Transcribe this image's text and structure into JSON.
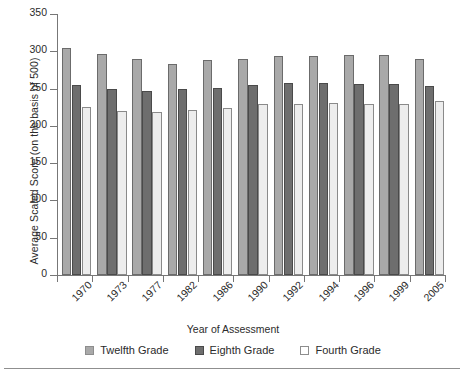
{
  "chart_data": {
    "type": "bar",
    "title": "",
    "xlabel": "Year of Assessment",
    "ylabel": "Average Scaled Score (on the basis of 500)",
    "categories": [
      "1970",
      "1973",
      "1977",
      "1982",
      "1986",
      "1990",
      "1992",
      "1994",
      "1996",
      "1999",
      "2005"
    ],
    "series": [
      {
        "name": "Twelfth Grade",
        "color": "#a9a9a9",
        "values": [
          305,
          296,
          290,
          283,
          288,
          290,
          294,
          294,
          295,
          295,
          290
        ]
      },
      {
        "name": "Eighth Grade",
        "color": "#6e6e6e",
        "values": [
          255,
          250,
          247,
          250,
          251,
          255,
          258,
          257,
          256,
          256,
          254
        ]
      },
      {
        "name": "Fourth Grade",
        "color": "#ededed",
        "values": [
          225,
          220,
          219,
          221,
          224,
          229,
          230,
          231,
          230,
          229,
          233
        ]
      }
    ],
    "ylim": [
      0,
      350
    ],
    "yticks": [
      0,
      50,
      100,
      150,
      200,
      250,
      300,
      350
    ],
    "grid": false,
    "legend_position": "bottom",
    "xtick_rotation": -45
  },
  "legend": {
    "items": [
      {
        "label": "Twelfth Grade",
        "swatch": "legend-swatch-twelfth"
      },
      {
        "label": "Eighth Grade",
        "swatch": "legend-swatch-eighth"
      },
      {
        "label": "Fourth Grade",
        "swatch": "legend-swatch-fourth"
      }
    ]
  }
}
